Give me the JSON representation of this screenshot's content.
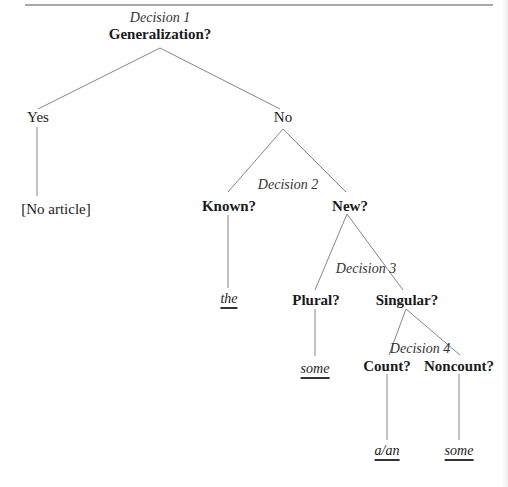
{
  "diagram": {
    "type": "decision-tree",
    "title_rule": true,
    "nodes": {
      "decision1": {
        "label": "Decision 1",
        "question": "Generalization?"
      },
      "yes": {
        "label": "Yes"
      },
      "no": {
        "label": "No"
      },
      "no_article": {
        "label": "[No article]"
      },
      "decision2": {
        "label": "Decision 2"
      },
      "known": {
        "label": "Known?"
      },
      "new": {
        "label": "New?"
      },
      "the": {
        "label": "the"
      },
      "decision3": {
        "label": "Decision 3"
      },
      "plural": {
        "label": "Plural?"
      },
      "singular": {
        "label": "Singular?"
      },
      "some_plural": {
        "label": "some"
      },
      "decision4": {
        "label": "Decision 4"
      },
      "count": {
        "label": "Count?"
      },
      "noncount": {
        "label": "Noncount?"
      },
      "a_an": {
        "label": "a/an"
      },
      "some_noncount": {
        "label": "some"
      }
    },
    "edges": [
      [
        "decision1",
        "yes"
      ],
      [
        "decision1",
        "no"
      ],
      [
        "yes",
        "no_article"
      ],
      [
        "no",
        "known"
      ],
      [
        "no",
        "new"
      ],
      [
        "known",
        "the"
      ],
      [
        "new",
        "plural"
      ],
      [
        "new",
        "singular"
      ],
      [
        "plural",
        "some_plural"
      ],
      [
        "singular",
        "count"
      ],
      [
        "singular",
        "noncount"
      ],
      [
        "count",
        "a_an"
      ],
      [
        "noncount",
        "some_noncount"
      ]
    ]
  }
}
